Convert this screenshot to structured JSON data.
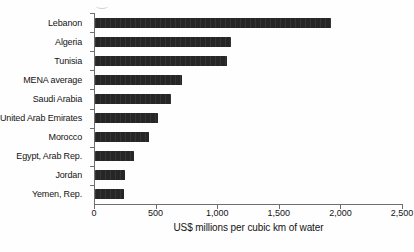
{
  "chart_data": {
    "type": "bar",
    "orientation": "horizontal",
    "title": "",
    "xlabel": "US$ millions per cubic km of water",
    "ylabel": "",
    "categories": [
      "Lebanon",
      "Algeria",
      "Tunisia",
      "MENA average",
      "Saudi Arabia",
      "United Arab Emirates",
      "Morocco",
      "Egypt, Arab Rep.",
      "Jordan",
      "Yemen, Rep."
    ],
    "values": [
      1925,
      1110,
      1075,
      710,
      615,
      510,
      440,
      315,
      245,
      240
    ],
    "xlim": [
      0,
      2500
    ],
    "x_ticks": [
      0,
      500,
      1000,
      1500,
      2000,
      2500
    ],
    "x_tick_labels": [
      "0",
      "500",
      "1,000",
      "1,500",
      "2,000",
      "2,500"
    ],
    "grid": false,
    "legend": false,
    "bar_color": "#262626",
    "axis_color": "#6e6e6e",
    "text_color": "#141414",
    "background_color": "#fefefe"
  }
}
